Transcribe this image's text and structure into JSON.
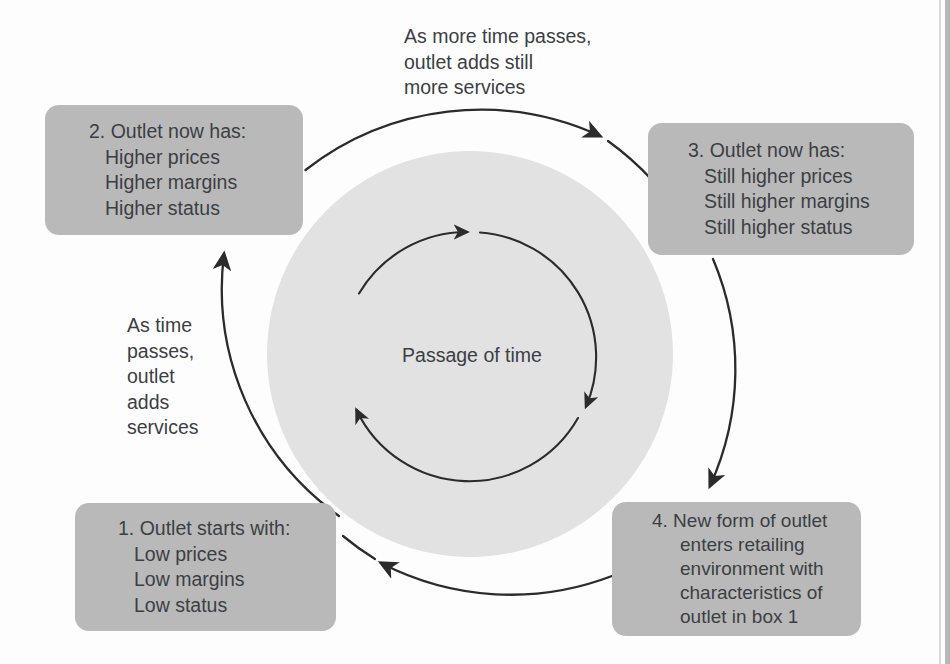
{
  "diagram": {
    "center_label": "Passage of time",
    "colors": {
      "box_fill": "#b9b9b9",
      "disc_fill": "#e2e2e2",
      "text": "#3b3f44",
      "stroke": "#2b2b2b",
      "background": "#fdfdfd"
    },
    "boxes": [
      {
        "id": "box-1",
        "heading": "1. Outlet starts with:",
        "items": [
          "Low prices",
          "Low margins",
          "Low status"
        ]
      },
      {
        "id": "box-2",
        "heading": "2. Outlet now has:",
        "items": [
          "Higher prices",
          "Higher margins",
          "Higher status"
        ]
      },
      {
        "id": "box-3",
        "heading": "3. Outlet now has:",
        "items": [
          "Still higher prices",
          "Still higher margins",
          "Still higher status"
        ]
      },
      {
        "id": "box-4",
        "heading": "4. New form of outlet",
        "items": [
          "enters retailing",
          "environment with",
          "characteristics of",
          "outlet in box 1"
        ]
      }
    ],
    "annotations": [
      {
        "id": "annot-left",
        "lines": [
          "As time",
          "passes,",
          "outlet",
          "adds",
          "services"
        ]
      },
      {
        "id": "annot-top",
        "lines": [
          "As more time passes,",
          "outlet adds still",
          "more services"
        ]
      }
    ],
    "arrows": {
      "outer_count": 4,
      "inner_count": 3,
      "direction": "clockwise"
    }
  }
}
